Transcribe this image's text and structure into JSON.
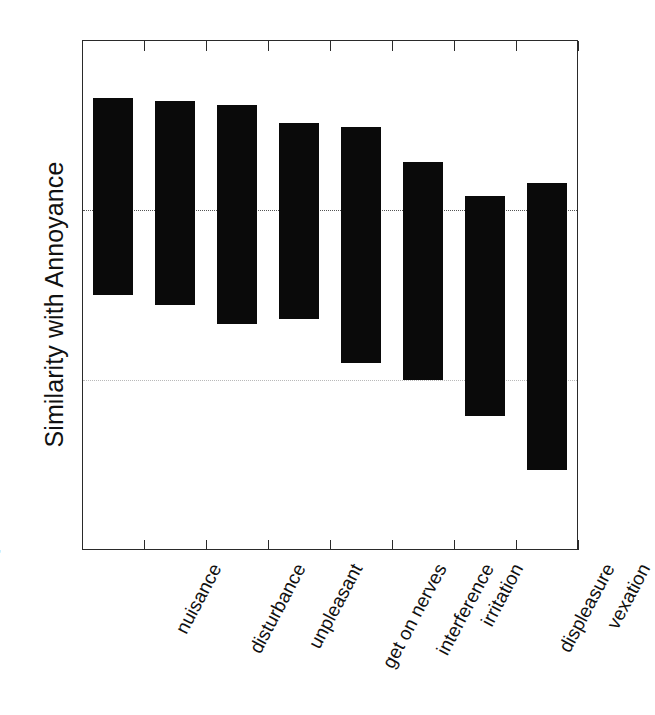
{
  "chart_data": {
    "type": "bar",
    "bar_style": "floating-range",
    "title": "",
    "subtitle": "",
    "xlabel": "",
    "ylabel": "Similarity with Annoyance",
    "ylim": [
      4,
      7
    ],
    "yticks": [
      4,
      5,
      6,
      7
    ],
    "ytick_labels": [
      "4",
      "5",
      "6",
      "7"
    ],
    "grid": true,
    "gridlines_at": [
      5,
      6
    ],
    "legend": null,
    "legend_position": "none",
    "categories": [
      "nuisance",
      "disturbance",
      "unpleasant",
      "get on nerves",
      "interference",
      "irritation",
      "displeasure",
      "vexation"
    ],
    "series": [
      {
        "name": "range high",
        "values": [
          6.66,
          6.64,
          6.62,
          6.51,
          6.49,
          6.28,
          6.08,
          6.16
        ]
      },
      {
        "name": "range low",
        "values": [
          5.5,
          5.44,
          5.33,
          5.36,
          5.1,
          5.0,
          4.79,
          4.47
        ]
      }
    ],
    "values_high": [
      6.66,
      6.64,
      6.62,
      6.51,
      6.49,
      6.28,
      6.08,
      6.16
    ],
    "values_low": [
      5.5,
      5.44,
      5.33,
      5.36,
      5.1,
      5.0,
      4.79,
      4.47
    ],
    "bar_color": "#0a0a0a",
    "axis_color": "#2a2a2a",
    "background_color": "#ffffff"
  },
  "axis": {
    "y_title": "Similarity with Annoyance"
  }
}
